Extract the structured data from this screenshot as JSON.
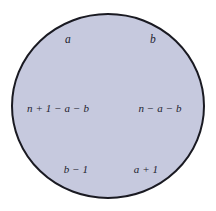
{
  "figure": {
    "type": "region-diagram",
    "shape": "circle",
    "background_color": "#ffffff",
    "circle": {
      "fill_color": "#c6c9de",
      "stroke_color": "#1a1a22",
      "stroke_width": 2,
      "center_x": 108,
      "center_y": 106,
      "radius_x": 96,
      "radius_y": 92
    },
    "text_color": "#22222e",
    "labels": [
      {
        "id": "top-left",
        "text": "a",
        "x": 68,
        "y": 40,
        "row": "top",
        "side": "left"
      },
      {
        "id": "top-right",
        "text": "b",
        "x": 153,
        "y": 40,
        "row": "top",
        "side": "right"
      },
      {
        "id": "mid-left",
        "text": "n + 1 − a − b",
        "x": 58,
        "y": 108,
        "row": "middle",
        "side": "left"
      },
      {
        "id": "mid-right",
        "text": "n − a − b",
        "x": 160,
        "y": 108,
        "row": "middle",
        "side": "right"
      },
      {
        "id": "bottom-left",
        "text": "b − 1",
        "x": 76,
        "y": 169,
        "row": "bottom",
        "side": "left"
      },
      {
        "id": "bottom-right",
        "text": "a + 1",
        "x": 146,
        "y": 169,
        "row": "bottom",
        "side": "right"
      }
    ]
  }
}
